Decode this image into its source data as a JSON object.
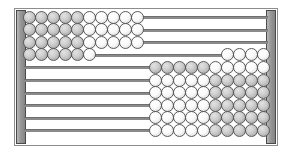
{
  "widget": {
    "name": "abacus",
    "title": "Abacus",
    "rod_count": 10,
    "beads_per_rod": 10,
    "colors": {
      "frame_border": "#8d8d8d",
      "post_fill": "#9a9a9a",
      "post_border": "#4a4a4a",
      "rod": "#8a8a8a",
      "bead_border": "#5b5b5b",
      "bead_light": "#f2f2f2",
      "bead_dark": "#c4c4c4",
      "background": "#ffffff"
    }
  },
  "rods": [
    {
      "index": 1,
      "label": "rod-1",
      "left_count": 10,
      "right_count": 0,
      "left_shading": [
        "dark",
        "dark",
        "dark",
        "dark",
        "dark",
        "light",
        "light",
        "light",
        "light",
        "light"
      ],
      "right_shading": []
    },
    {
      "index": 2,
      "label": "rod-2",
      "left_count": 10,
      "right_count": 0,
      "left_shading": [
        "dark",
        "dark",
        "dark",
        "dark",
        "dark",
        "light",
        "light",
        "light",
        "light",
        "light"
      ],
      "right_shading": []
    },
    {
      "index": 3,
      "label": "rod-3",
      "left_count": 10,
      "right_count": 0,
      "left_shading": [
        "dark",
        "dark",
        "dark",
        "dark",
        "dark",
        "light",
        "light",
        "light",
        "light",
        "light"
      ],
      "right_shading": []
    },
    {
      "index": 4,
      "label": "rod-4",
      "left_count": 6,
      "right_count": 4,
      "left_shading": [
        "dark",
        "dark",
        "dark",
        "dark",
        "dark",
        "light"
      ],
      "right_shading": [
        "light",
        "light",
        "light",
        "light"
      ]
    },
    {
      "index": 5,
      "label": "rod-5",
      "left_count": 0,
      "right_count": 10,
      "left_shading": [],
      "right_shading": [
        "dark",
        "dark",
        "dark",
        "dark",
        "dark",
        "light",
        "light",
        "light",
        "light",
        "light"
      ]
    },
    {
      "index": 6,
      "label": "rod-6",
      "left_count": 0,
      "right_count": 10,
      "left_shading": [],
      "right_shading": [
        "light",
        "light",
        "light",
        "light",
        "light",
        "dark",
        "dark",
        "dark",
        "dark",
        "dark"
      ]
    },
    {
      "index": 7,
      "label": "rod-7",
      "left_count": 0,
      "right_count": 10,
      "left_shading": [],
      "right_shading": [
        "light",
        "light",
        "light",
        "light",
        "light",
        "dark",
        "dark",
        "dark",
        "dark",
        "dark"
      ]
    },
    {
      "index": 8,
      "label": "rod-8",
      "left_count": 0,
      "right_count": 10,
      "left_shading": [],
      "right_shading": [
        "light",
        "light",
        "light",
        "light",
        "light",
        "dark",
        "dark",
        "dark",
        "dark",
        "dark"
      ]
    },
    {
      "index": 9,
      "label": "rod-9",
      "left_count": 0,
      "right_count": 10,
      "left_shading": [],
      "right_shading": [
        "light",
        "light",
        "light",
        "light",
        "light",
        "dark",
        "dark",
        "dark",
        "dark",
        "dark"
      ]
    },
    {
      "index": 10,
      "label": "rod-10",
      "left_count": 0,
      "right_count": 10,
      "left_shading": [],
      "right_shading": [
        "light",
        "light",
        "light",
        "light",
        "light",
        "dark",
        "dark",
        "dark",
        "dark",
        "dark"
      ]
    }
  ]
}
